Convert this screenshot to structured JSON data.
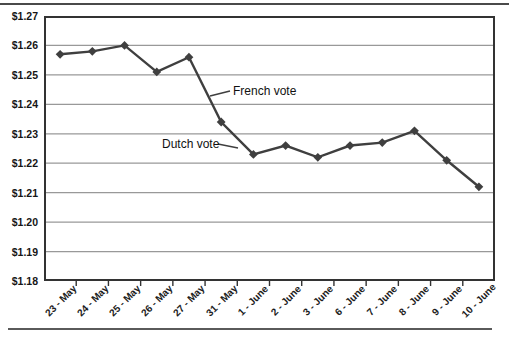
{
  "chart_data": {
    "type": "line",
    "title": "",
    "xlabel": "",
    "ylabel": "",
    "categories": [
      "23 - May",
      "24 - May",
      "25 - May",
      "26 - May",
      "27 - May",
      "31 - May",
      "1 - June",
      "2 - June",
      "3 - June",
      "6 - June",
      "7 - June",
      "8 - June",
      "9 - June",
      "10 - June"
    ],
    "series": [
      {
        "name": "dollar-per-euro-rate",
        "values": [
          1.257,
          1.258,
          1.26,
          1.251,
          1.256,
          1.234,
          1.223,
          1.226,
          1.222,
          1.226,
          1.227,
          1.231,
          1.221,
          1.212
        ]
      }
    ],
    "y_ticks": [
      "$1.18",
      "$1.19",
      "$1.20",
      "$1.21",
      "$1.22",
      "$1.23",
      "$1.24",
      "$1.25",
      "$1.26",
      "$1.27"
    ],
    "ylim": [
      1.18,
      1.27
    ],
    "grid": "horizontal",
    "legend": "none",
    "marker": "diamond",
    "line_color": "#3f3f3f",
    "grid_color": "#999999",
    "frame_color": "#333333",
    "annotations": [
      {
        "text": "French vote",
        "points_to": "drop between 27 - May and 31 - May"
      },
      {
        "text": "Dutch vote",
        "points_to": "drop between 31 - May and 1 - June"
      }
    ]
  }
}
